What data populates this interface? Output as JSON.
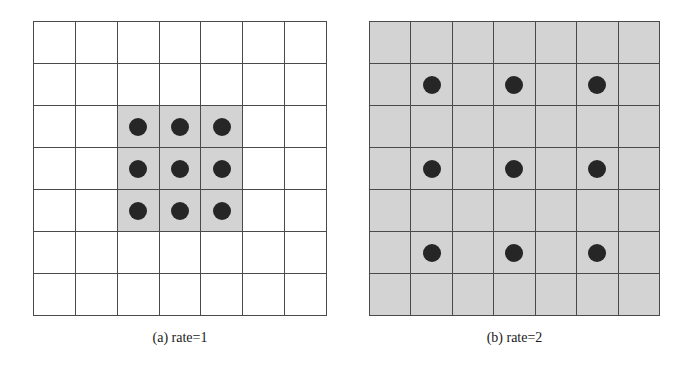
{
  "figure": {
    "panels": [
      {
        "id": "a",
        "caption": "(a) rate=1",
        "rows": 7,
        "cols": 7,
        "grid_box": {
          "x": 33,
          "y": 21,
          "w": 294,
          "h": 295
        },
        "background_color": "#ffffff",
        "shaded_color": "#d3d3d3",
        "shaded_region": {
          "row_start": 2,
          "row_end": 4,
          "col_start": 2,
          "col_end": 4
        },
        "dots": [
          [
            2,
            2
          ],
          [
            2,
            3
          ],
          [
            2,
            4
          ],
          [
            3,
            2
          ],
          [
            3,
            3
          ],
          [
            3,
            4
          ],
          [
            4,
            2
          ],
          [
            4,
            3
          ],
          [
            4,
            4
          ]
        ],
        "caption_box": {
          "x": 33,
          "y": 330,
          "w": 294
        }
      },
      {
        "id": "b",
        "caption": "(b) rate=2",
        "rows": 7,
        "cols": 7,
        "grid_box": {
          "x": 369,
          "y": 21,
          "w": 291,
          "h": 295
        },
        "background_color": "#d3d3d3",
        "shaded_color": "#d3d3d3",
        "shaded_region": {
          "row_start": 0,
          "row_end": 6,
          "col_start": 0,
          "col_end": 6
        },
        "dots": [
          [
            1,
            1
          ],
          [
            1,
            3
          ],
          [
            1,
            5
          ],
          [
            3,
            1
          ],
          [
            3,
            3
          ],
          [
            3,
            5
          ],
          [
            5,
            1
          ],
          [
            5,
            3
          ],
          [
            5,
            5
          ]
        ],
        "caption_box": {
          "x": 369,
          "y": 330,
          "w": 291
        }
      }
    ],
    "colors": {
      "grid_line": "#4a4a4a",
      "dot": "#262626",
      "shade": "#d3d3d3"
    }
  }
}
